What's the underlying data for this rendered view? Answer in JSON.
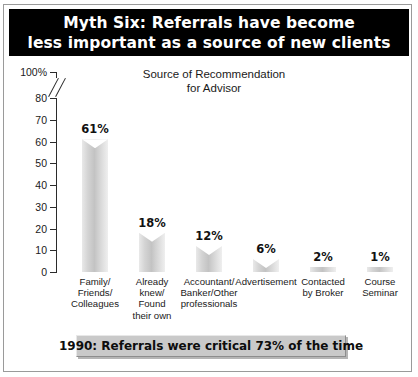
{
  "title": {
    "line1": "Myth Six: Referrals have become",
    "line2": "less important as a source of new clients"
  },
  "footer": {
    "text": "1990: Referrals were critical 73% of the time"
  },
  "colors": {
    "banner_background": "#000000",
    "banner_text": "#ffffff",
    "bar_fill": "#c9c9c9",
    "footer_background": "#c9c9c9",
    "axis": "#2b2b2b",
    "frame": "#9a9a9a"
  },
  "chart_data": {
    "type": "bar",
    "title": "Source of Recommendation for Advisor",
    "subtitle_line1": "Source of Recommendation",
    "subtitle_line2": "for Advisor",
    "xlabel": "",
    "ylabel": "",
    "ylim": [
      0,
      100
    ],
    "grid": false,
    "legend": "none",
    "axis_break": {
      "present": true,
      "between": [
        80,
        100
      ],
      "style": "double-slash"
    },
    "ytick_labels": [
      "100%",
      "80",
      "70",
      "60",
      "50",
      "40",
      "30",
      "20",
      "10",
      "0"
    ],
    "ytick_values": [
      100,
      80,
      70,
      60,
      50,
      40,
      30,
      20,
      10,
      0
    ],
    "categories": [
      "Family/ Friends/ Colleagues",
      "Already knew/ Found their own",
      "Accountant/ Banker/Other professionals",
      "Advertisement",
      "Contacted by Broker",
      "Course Seminar"
    ],
    "category_lines": [
      [
        "Family/",
        "Friends/",
        "Colleagues"
      ],
      [
        "Already",
        "knew/",
        "Found",
        "their own"
      ],
      [
        "Accountant/",
        "Banker/Other",
        "professionals"
      ],
      [
        "Advertisement"
      ],
      [
        "Contacted",
        "by Broker"
      ],
      [
        "Course",
        "Seminar"
      ]
    ],
    "values": [
      61,
      18,
      12,
      6,
      2,
      1
    ],
    "value_labels": [
      "61%",
      "18%",
      "12%",
      "6%",
      "2%",
      "1%"
    ]
  }
}
